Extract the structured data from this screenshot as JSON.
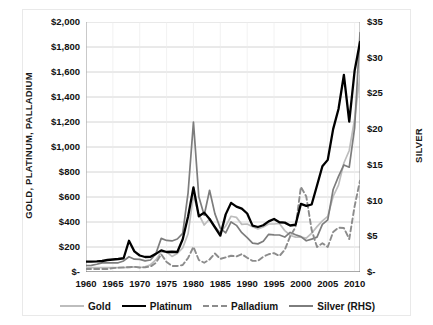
{
  "chart_data": {
    "type": "line",
    "title": "",
    "xlabel": "",
    "ylabel": "GOLD, PLATINUM, PALLADIUM",
    "y2label": "SILVER",
    "grid": true,
    "legend_position": "bottom",
    "xlim": [
      1960,
      2011
    ],
    "ylim": [
      0,
      2000
    ],
    "y2lim": [
      0,
      35
    ],
    "x_ticks": [
      "1960",
      "1965",
      "1970",
      "1975",
      "1980",
      "1985",
      "1990",
      "1995",
      "2000",
      "2005",
      "2010"
    ],
    "x_tick_values": [
      1960,
      1965,
      1970,
      1975,
      1980,
      1985,
      1990,
      1995,
      2000,
      2005,
      2010
    ],
    "y_ticks": [
      "$-",
      "$200",
      "$400",
      "$600",
      "$800",
      "$1,000",
      "$1,200",
      "$1,400",
      "$1,600",
      "$1,800",
      "$2,000"
    ],
    "y_tick_values": [
      0,
      200,
      400,
      600,
      800,
      1000,
      1200,
      1400,
      1600,
      1800,
      2000
    ],
    "y2_ticks": [
      "$-",
      "$5",
      "$10",
      "$15",
      "$20",
      "$25",
      "$30",
      "$35"
    ],
    "y2_tick_values": [
      0,
      5,
      10,
      15,
      20,
      25,
      30,
      35
    ],
    "x": [
      1960,
      1961,
      1962,
      1963,
      1964,
      1965,
      1966,
      1967,
      1968,
      1969,
      1970,
      1971,
      1972,
      1973,
      1974,
      1975,
      1976,
      1977,
      1978,
      1979,
      1980,
      1981,
      1982,
      1983,
      1984,
      1985,
      1986,
      1987,
      1988,
      1989,
      1990,
      1991,
      1992,
      1993,
      1994,
      1995,
      1996,
      1997,
      1998,
      1999,
      2000,
      2001,
      2002,
      2003,
      2004,
      2005,
      2006,
      2007,
      2008,
      2009,
      2010,
      2011
    ],
    "series": [
      {
        "name": "Gold",
        "axis": "left",
        "color": "#bdbdbd",
        "style": "solid",
        "values": [
          35,
          35,
          35,
          35,
          35,
          35,
          35,
          35,
          39,
          41,
          36,
          41,
          58,
          97,
          159,
          161,
          125,
          148,
          193,
          306,
          613,
          460,
          376,
          424,
          361,
          317,
          368,
          446,
          437,
          381,
          384,
          362,
          344,
          360,
          384,
          384,
          388,
          331,
          294,
          279,
          279,
          271,
          310,
          363,
          409,
          445,
          604,
          695,
          872,
          972,
          1225,
          1572
        ]
      },
      {
        "name": "Platinum",
        "axis": "left",
        "color": "#000000",
        "style": "solid",
        "values": [
          83,
          83,
          85,
          88,
          96,
          100,
          104,
          110,
          250,
          165,
          132,
          120,
          122,
          145,
          173,
          160,
          162,
          160,
          262,
          444,
          677,
          446,
          475,
          424,
          358,
          291,
          461,
          553,
          523,
          507,
          468,
          371,
          360,
          374,
          405,
          424,
          398,
          395,
          372,
          378,
          545,
          529,
          540,
          692,
          846,
          897,
          1143,
          1304,
          1576,
          1203,
          1610,
          1840
        ]
      },
      {
        "name": "Palladium",
        "axis": "left",
        "color": "#8c8c8c",
        "style": "dashed",
        "values": [
          24,
          24,
          24,
          24,
          24,
          31,
          35,
          37,
          38,
          42,
          36,
          38,
          43,
          73,
          142,
          80,
          48,
          48,
          56,
          112,
          201,
          96,
          74,
          100,
          148,
          105,
          117,
          130,
          125,
          143,
          114,
          89,
          89,
          122,
          142,
          151,
          128,
          177,
          285,
          359,
          681,
          604,
          337,
          200,
          230,
          201,
          320,
          355,
          352,
          263,
          527,
          731
        ]
      },
      {
        "name": "Silver (RHS)",
        "axis": "right",
        "color": "#7d7d7d",
        "style": "solid",
        "values": [
          0.91,
          0.92,
          1.08,
          1.28,
          1.29,
          1.29,
          1.29,
          1.55,
          2.14,
          1.79,
          1.77,
          1.55,
          1.68,
          2.56,
          4.71,
          4.42,
          4.35,
          4.62,
          5.4,
          11.09,
          20.98,
          10.52,
          7.95,
          11.44,
          8.14,
          6.14,
          5.47,
          7.01,
          6.53,
          5.5,
          4.82,
          4.04,
          3.94,
          4.3,
          5.28,
          5.19,
          5.18,
          4.89,
          5.54,
          5.22,
          4.95,
          4.37,
          4.6,
          4.88,
          6.67,
          7.31,
          11.55,
          13.38,
          14.99,
          14.67,
          20.19,
          33.5
        ]
      }
    ]
  },
  "legend": {
    "items": [
      {
        "label": "Gold",
        "color": "#bdbdbd",
        "style": "solid"
      },
      {
        "label": "Platinum",
        "color": "#000000",
        "style": "solid"
      },
      {
        "label": "Palladium",
        "color": "#8c8c8c",
        "style": "dashed"
      },
      {
        "label": "Silver (RHS)",
        "color": "#7d7d7d",
        "style": "solid"
      }
    ]
  }
}
